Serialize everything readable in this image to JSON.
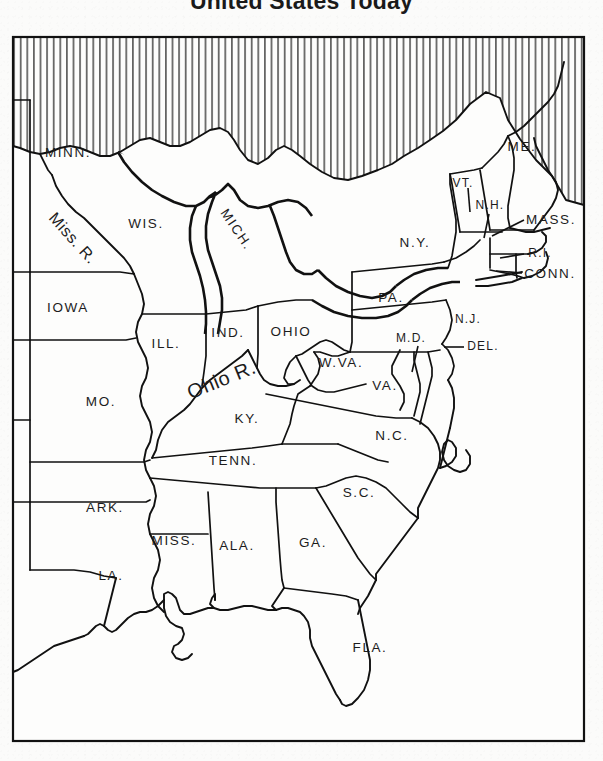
{
  "title": "United States Today",
  "map": {
    "frame": {
      "x": 12,
      "y": 36,
      "width": 573,
      "height": 706
    },
    "hatch_legend": "vertical-line-hatching-canada",
    "state_labels": [
      {
        "id": "minn",
        "text": "MINN.",
        "x": 68,
        "y": 153,
        "rot": 0,
        "size": "normal"
      },
      {
        "id": "wis",
        "text": "WIS.",
        "x": 146,
        "y": 224,
        "rot": 0,
        "size": "normal"
      },
      {
        "id": "mich",
        "text": "MICH.",
        "x": 236,
        "y": 230,
        "rot": 56,
        "size": "normal"
      },
      {
        "id": "iowa",
        "text": "IOWA",
        "x": 68,
        "y": 308,
        "rot": 0,
        "size": "normal"
      },
      {
        "id": "ill",
        "text": "ILL.",
        "x": 166,
        "y": 344,
        "rot": 0,
        "size": "normal"
      },
      {
        "id": "ind",
        "text": "IND.",
        "x": 228,
        "y": 333,
        "rot": 0,
        "size": "normal"
      },
      {
        "id": "ohio",
        "text": "OHIO",
        "x": 291,
        "y": 332,
        "rot": 0,
        "size": "normal"
      },
      {
        "id": "mo",
        "text": "MO.",
        "x": 101,
        "y": 402,
        "rot": 0,
        "size": "normal"
      },
      {
        "id": "ky",
        "text": "KY.",
        "x": 247,
        "y": 419,
        "rot": 0,
        "size": "normal"
      },
      {
        "id": "tenn",
        "text": "TENN.",
        "x": 233,
        "y": 461,
        "rot": 0,
        "size": "normal"
      },
      {
        "id": "ark",
        "text": "ARK.",
        "x": 105,
        "y": 508,
        "rot": 0,
        "size": "normal"
      },
      {
        "id": "miss",
        "text": "MISS.",
        "x": 174,
        "y": 541,
        "rot": 0,
        "size": "normal"
      },
      {
        "id": "ala",
        "text": "ALA.",
        "x": 237,
        "y": 546,
        "rot": 0,
        "size": "normal"
      },
      {
        "id": "ga",
        "text": "GA.",
        "x": 313,
        "y": 543,
        "rot": 0,
        "size": "normal"
      },
      {
        "id": "la",
        "text": "LA.",
        "x": 111,
        "y": 576,
        "rot": 0,
        "size": "normal"
      },
      {
        "id": "fla",
        "text": "FLA.",
        "x": 370,
        "y": 648,
        "rot": 0,
        "size": "normal"
      },
      {
        "id": "sc",
        "text": "S.C.",
        "x": 359,
        "y": 493,
        "rot": 0,
        "size": "normal"
      },
      {
        "id": "nc",
        "text": "N.C.",
        "x": 392,
        "y": 436,
        "rot": 0,
        "size": "normal"
      },
      {
        "id": "va",
        "text": "VA.",
        "x": 385,
        "y": 386,
        "rot": 0,
        "size": "normal"
      },
      {
        "id": "wva",
        "text": "W.VA.",
        "x": 341,
        "y": 363,
        "rot": 0,
        "size": "normal"
      },
      {
        "id": "pa",
        "text": "PA.",
        "x": 391,
        "y": 298,
        "rot": 0,
        "size": "normal"
      },
      {
        "id": "md",
        "text": "M.D.",
        "x": 411,
        "y": 339,
        "rot": 0,
        "size": "small"
      },
      {
        "id": "del",
        "text": "DEL.",
        "x": 483,
        "y": 347,
        "rot": 0,
        "size": "small"
      },
      {
        "id": "nj",
        "text": "N.J.",
        "x": 468,
        "y": 320,
        "rot": 0,
        "size": "small"
      },
      {
        "id": "ny",
        "text": "N.Y.",
        "x": 415,
        "y": 243,
        "rot": 0,
        "size": "normal"
      },
      {
        "id": "vt",
        "text": "VT.",
        "x": 463,
        "y": 184,
        "rot": 0,
        "size": "small"
      },
      {
        "id": "nh",
        "text": "N.H.",
        "x": 490,
        "y": 206,
        "rot": 0,
        "size": "small"
      },
      {
        "id": "me",
        "text": "ME.",
        "x": 522,
        "y": 147,
        "rot": 0,
        "size": "normal"
      },
      {
        "id": "mass",
        "text": "MASS.",
        "x": 551,
        "y": 220,
        "rot": 0,
        "size": "normal"
      },
      {
        "id": "ri",
        "text": "R.I.",
        "x": 540,
        "y": 254,
        "rot": 0,
        "size": "small"
      },
      {
        "id": "conn",
        "text": "CONN.",
        "x": 550,
        "y": 274,
        "rot": 0,
        "size": "normal"
      }
    ],
    "river_labels": [
      {
        "id": "mississippi",
        "text": "Miss. R.",
        "x": 72,
        "y": 239,
        "rot": 48,
        "size": "normal"
      },
      {
        "id": "ohio",
        "text": "Ohio R.",
        "x": 222,
        "y": 381,
        "rot": -22,
        "size": "big"
      }
    ]
  },
  "colors": {
    "ink": "#111111",
    "paper": "#fbfbfa",
    "land": "#fdfdfc"
  }
}
